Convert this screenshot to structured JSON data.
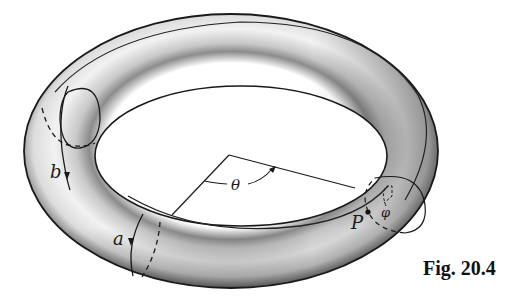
{
  "figure": {
    "caption": "Fig. 20.4",
    "labels": {
      "loop_a": "a",
      "loop_b": "b",
      "angle_theta": "θ",
      "angle_phi": "φ",
      "point_p": "P"
    },
    "colors": {
      "outline": "#1a1a1a",
      "surface_light": "#f4f4f4",
      "surface_dark": "#6e6e6e",
      "background": "#ffffff"
    }
  }
}
